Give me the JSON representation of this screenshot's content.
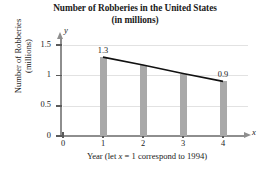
{
  "chart_data": {
    "type": "bar",
    "title": "Number of Robberies in the United States (in millions)",
    "title_line1": "Number of Robberies in the United States",
    "title_line2": "(in millions)",
    "xlabel": "Year (let x = 1 correspond to 1994)",
    "xlabel_prefix": "Year (let ",
    "xlabel_var": "x",
    "xlabel_suffix": " = 1 correspond to 1994)",
    "ylabel": "Number of Robberies (millions)",
    "ylabel_line1": "Number of Robberies",
    "ylabel_line2": "(millions)",
    "x_axis_variable": "x",
    "y_axis_variable": "y",
    "categories": [
      1,
      2,
      3,
      4
    ],
    "x": [
      1,
      2,
      3,
      4
    ],
    "values": [
      1.3,
      1.17,
      1.03,
      0.9
    ],
    "data_labels": [
      "1.3",
      "",
      "",
      "0.9"
    ],
    "xticks": [
      "0",
      "1",
      "2",
      "3",
      "4"
    ],
    "yticks": [
      "0",
      "0.5",
      "1",
      "1.5"
    ],
    "ytick_values": [
      0,
      0.5,
      1,
      1.5
    ],
    "xlim": [
      0,
      4.6
    ],
    "ylim": [
      0,
      1.5
    ],
    "grid": "horizontal",
    "legend": "none",
    "series": [
      {
        "name": "Robberies (millions)",
        "values": [
          1.3,
          1.17,
          1.03,
          0.9
        ]
      }
    ],
    "overlay": {
      "type": "line",
      "name": "trend line",
      "x": [
        1,
        2,
        3,
        4
      ],
      "values": [
        1.3,
        1.17,
        1.03,
        0.9
      ],
      "color": "#111111"
    },
    "colors": {
      "bar": "#a9a9a9",
      "grid": "#e2e2e2",
      "axis": "#8e8e8e",
      "line": "#111111",
      "text": "#1a1a1a"
    }
  }
}
